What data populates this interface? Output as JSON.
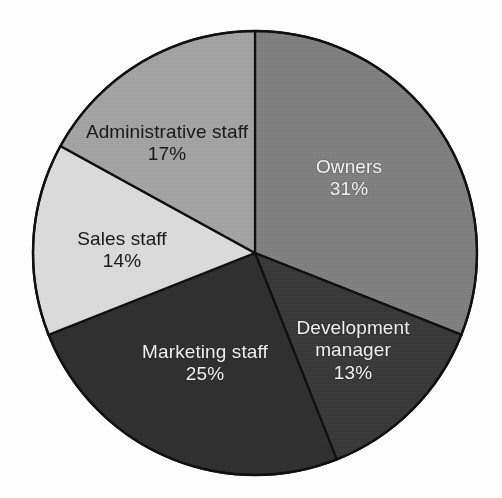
{
  "chart_data": {
    "type": "pie",
    "title": "",
    "subtitle": "",
    "xlabel": "",
    "ylabel": "",
    "legend": "none",
    "grid": false,
    "units": "percent",
    "start_angle_deg": 0,
    "direction": "clockwise",
    "categories": [
      "Owners",
      "Development manager",
      "Marketing staff",
      "Sales staff",
      "Administrative staff"
    ],
    "values": [
      31,
      13,
      25,
      14,
      17
    ],
    "slices": [
      {
        "label": "Owners",
        "label_lines": [
          "Owners"
        ],
        "value": 31,
        "value_label": "31%",
        "color": "#878787",
        "text_color": "#f2f2f2",
        "label_x": 349,
        "label_y": 178
      },
      {
        "label": "Development manager",
        "label_lines": [
          "Development",
          "manager"
        ],
        "value": 13,
        "value_label": "13%",
        "color": "#3d3d3d",
        "text_color": "#f2f2f2",
        "label_x": 353,
        "label_y": 351
      },
      {
        "label": "Marketing staff",
        "label_lines": [
          "Marketing staff"
        ],
        "value": 25,
        "value_label": "25%",
        "color": "#333333",
        "text_color": "#f2f2f2",
        "label_x": 205,
        "label_y": 363
      },
      {
        "label": "Sales staff",
        "label_lines": [
          "Sales staff"
        ],
        "value": 14,
        "value_label": "14%",
        "color": "#dcdcdc",
        "text_color": "#1c1c1c",
        "label_x": 122,
        "label_y": 250
      },
      {
        "label": "Administrative staff",
        "label_lines": [
          "Administrative staff"
        ],
        "value": 17,
        "value_label": "17%",
        "color": "#a8a8a8",
        "text_color": "#1c1c1c",
        "label_x": 167,
        "label_y": 143
      }
    ],
    "geometry": {
      "center_x": 255,
      "center_y": 253,
      "radius": 222
    },
    "colors": {
      "outline": "#111111",
      "background": "#fefefe"
    }
  }
}
